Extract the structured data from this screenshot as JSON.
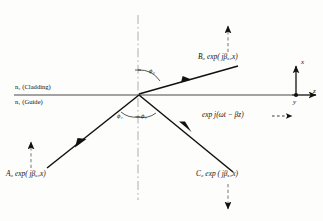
{
  "figure": {
    "type": "optics-ray-diagram",
    "background_color": "#fdfdfc",
    "line_color": "#111111",
    "interface_color": "#4a4a4a",
    "dashdot_color": "#9a9a9a"
  },
  "media": {
    "cladding": "n₂ (Cladding)",
    "guide": "n₁ (Guide)"
  },
  "angles": {
    "phi2": "ϕ₂",
    "phi1_left": "ϕ₁",
    "phi1_right": "ϕ₁"
  },
  "waves": {
    "incident": "A₀ exp( jβₓ₂x)",
    "transmitted": "B₀ exp( jβₓ₂x)",
    "reflected": "C₀ exp ( jβₓ₂x)",
    "propagation": "exp j(ωt − βz)"
  },
  "axes": {
    "x": "x",
    "y": "y",
    "z": "z"
  },
  "icons": {
    "arrow_up": "arrow-up-icon",
    "arrow_down": "arrow-down-icon",
    "arrow_right": "arrow-right-icon",
    "origin_dot": "origin-dot-icon"
  }
}
